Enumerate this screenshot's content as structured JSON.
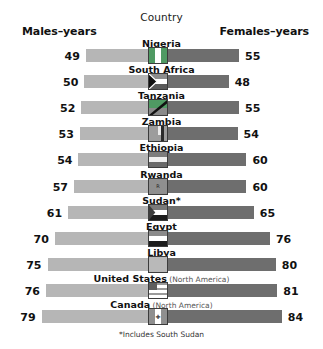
{
  "header": {
    "country_label": "Country",
    "males_label": "Males–years",
    "females_label": "Females–years"
  },
  "footnote": "*Includes South Sudan",
  "colors": {
    "male_bar": "#b6b6b6",
    "female_bar": "#6e6e6e",
    "text": "#111111",
    "region_text": "#555555",
    "background": "#ffffff"
  },
  "chart_data": {
    "type": "bar",
    "subtitle": "",
    "xlabel": "",
    "ylabel": "Country",
    "orientation": "horizontal-diverging",
    "grid": false,
    "legend_position": "top",
    "categories": [
      "Nigeria",
      "South Africa",
      "Tanzania",
      "Zambia",
      "Ethiopia",
      "Rwanda",
      "Sudan*",
      "Egypt",
      "Libya",
      "United States",
      "Canada"
    ],
    "series": [
      {
        "name": "Males–years",
        "values": [
          49,
          50,
          52,
          53,
          54,
          57,
          61,
          70,
          75,
          76,
          79
        ]
      },
      {
        "name": "Females–years",
        "values": [
          55,
          48,
          55,
          54,
          60,
          60,
          65,
          76,
          80,
          81,
          84
        ]
      }
    ],
    "annotations": [
      "*Includes South Sudan"
    ]
  },
  "rows": [
    {
      "country": "Nigeria",
      "region": "",
      "male": "49",
      "female": "55",
      "flag": "nigeria-flag"
    },
    {
      "country": "South Africa",
      "region": "",
      "male": "50",
      "female": "48",
      "flag": "south-africa-flag"
    },
    {
      "country": "Tanzania",
      "region": "",
      "male": "52",
      "female": "55",
      "flag": "tanzania-flag"
    },
    {
      "country": "Zambia",
      "region": "",
      "male": "53",
      "female": "54",
      "flag": "zambia-flag"
    },
    {
      "country": "Ethiopia",
      "region": "",
      "male": "54",
      "female": "60",
      "flag": "ethiopia-flag"
    },
    {
      "country": "Rwanda",
      "region": "",
      "male": "57",
      "female": "60",
      "flag": "rwanda-flag"
    },
    {
      "country": "Sudan*",
      "region": "",
      "male": "61",
      "female": "65",
      "flag": "sudan-flag"
    },
    {
      "country": "Egypt",
      "region": "",
      "male": "70",
      "female": "76",
      "flag": "egypt-flag"
    },
    {
      "country": "Libya",
      "region": "",
      "male": "75",
      "female": "80",
      "flag": "libya-flag"
    },
    {
      "country": "United States",
      "region": "(North America)",
      "male": "76",
      "female": "81",
      "flag": "united-states-flag"
    },
    {
      "country": "Canada",
      "region": "(North America)",
      "male": "79",
      "female": "84",
      "flag": "canada-flag"
    }
  ]
}
